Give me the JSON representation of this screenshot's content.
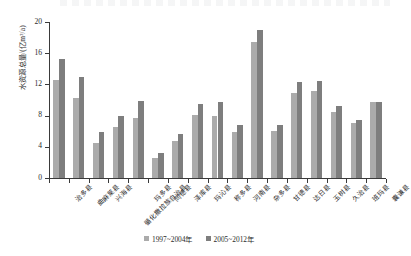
{
  "chart_data": {
    "type": "bar",
    "title": "",
    "xlabel": "",
    "ylabel": "水资源总量/(亿m³/a)",
    "ylim": [
      0,
      20
    ],
    "yticks": [
      0,
      4,
      8,
      12,
      16,
      20
    ],
    "ytick_labels": [
      "0",
      "4",
      "8",
      "12",
      "16",
      "20"
    ],
    "grid": false,
    "legend_position": "bottom-center",
    "categories": [
      "治多县",
      "曲麻莱县",
      "兴海县",
      "循化撒拉族自治县",
      "玛多县",
      "同德县",
      "泽库县",
      "玛沁县",
      "称多县",
      "河南县",
      "杂多县",
      "甘德县",
      "达日县",
      "玉树县",
      "久治县",
      "班玛县",
      "囊谦县"
    ],
    "series": [
      {
        "name": "1997~2004年",
        "color": "#ababab",
        "values": [
          12.6,
          10.2,
          4.5,
          6.5,
          7.7,
          2.6,
          4.7,
          8.1,
          8.0,
          5.9,
          17.5,
          6.0,
          10.9,
          11.2,
          8.4,
          7.0,
          9.7
        ]
      },
      {
        "name": "2005~2012年",
        "color": "#7e7e7e",
        "values": [
          15.3,
          13.0,
          5.9,
          7.9,
          9.9,
          3.2,
          5.6,
          9.5,
          9.7,
          6.8,
          19.0,
          6.8,
          12.3,
          12.4,
          9.2,
          7.5,
          9.8
        ]
      }
    ],
    "legend": [
      "1997~2004年",
      "2005~2012年"
    ]
  },
  "colors": {
    "series_1997_2004": "#ababab",
    "series_2005_2012": "#7e7e7e",
    "axis": "#3a3a3a",
    "text": "#2b2b2b",
    "background": "#ffffff"
  }
}
